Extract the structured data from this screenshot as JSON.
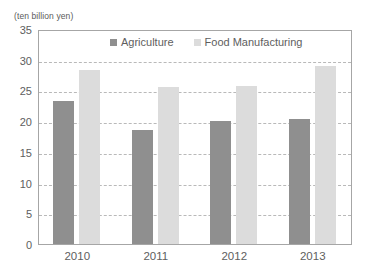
{
  "chart_data": {
    "type": "bar",
    "title": "",
    "subtitle": "",
    "xlabel": "",
    "ylabel": "(ten billion yen)",
    "unit_caption": "(ten billion yen)",
    "categories": [
      "2010",
      "2011",
      "2012",
      "2013"
    ],
    "series": [
      {
        "name": "Agriculture",
        "color": "#8f8f8f",
        "values": [
          23.3,
          18.6,
          20.1,
          20.3
        ]
      },
      {
        "name": "Food Manufacturing",
        "color": "#dcdcdc",
        "values": [
          28.3,
          25.5,
          25.8,
          29.0
        ]
      }
    ],
    "ylim": [
      0,
      35
    ],
    "yticks": [
      "0",
      "5",
      "10",
      "15",
      "20",
      "25",
      "30",
      "35"
    ],
    "ytick_values": [
      0,
      5,
      10,
      15,
      20,
      25,
      30,
      35
    ],
    "grid": true,
    "grid_axis": "y",
    "grid_style": "dashed",
    "legend_position": "top-center",
    "plot_border": true,
    "background": "#ffffff",
    "text_color": "#5e5e5e"
  }
}
